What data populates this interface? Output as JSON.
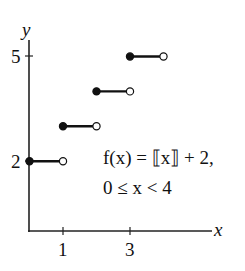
{
  "chart_data": {
    "type": "step",
    "title": "",
    "function_label": "f(x) = ⟦x⟧ + 2,",
    "domain_label": "0 ≤ x < 4",
    "xlabel": "x",
    "ylabel": "y",
    "x_ticks": [
      1,
      3
    ],
    "x_tick_labels": [
      "1",
      "3"
    ],
    "y_ticks": [
      2,
      5
    ],
    "y_tick_labels": [
      "2",
      "5"
    ],
    "xlim": [
      0,
      4.4
    ],
    "ylim": [
      0,
      5.4
    ],
    "grid": false,
    "segments": [
      {
        "x_start": 0,
        "x_end": 1,
        "y": 2,
        "start_closed": true,
        "end_closed": false
      },
      {
        "x_start": 1,
        "x_end": 2,
        "y": 3,
        "start_closed": true,
        "end_closed": false
      },
      {
        "x_start": 2,
        "x_end": 3,
        "y": 4,
        "start_closed": true,
        "end_closed": false
      },
      {
        "x_start": 3,
        "x_end": 4,
        "y": 5,
        "start_closed": true,
        "end_closed": false
      }
    ]
  },
  "labels": {
    "y_axis": "y",
    "x_axis": "x",
    "tick_x_1": "1",
    "tick_x_3": "3",
    "tick_y_2": "2",
    "tick_y_5": "5",
    "formula_line1": "f(x) = ⟦x⟧ + 2,",
    "formula_line2": "0 ≤ x < 4"
  }
}
